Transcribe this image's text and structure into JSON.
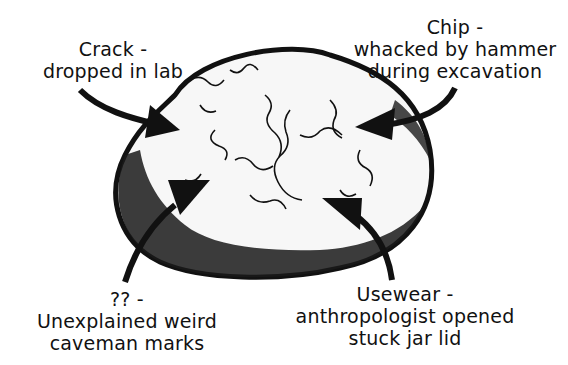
{
  "diagram": {
    "annotations": [
      {
        "id": "crack",
        "title": "Crack -",
        "description": "dropped in lab"
      },
      {
        "id": "chip",
        "title": "Chip -",
        "description_lines": [
          "whacked by hammer",
          "during excavation"
        ]
      },
      {
        "id": "unexplained",
        "title": "?? -",
        "description_lines": [
          "Unexplained weird",
          "caveman marks"
        ]
      },
      {
        "id": "usewear",
        "title": "Usewear -",
        "description_lines": [
          "anthropologist opened",
          "stuck jar lid"
        ]
      }
    ]
  },
  "colors": {
    "ink": "#111111",
    "background": "#ffffff"
  }
}
